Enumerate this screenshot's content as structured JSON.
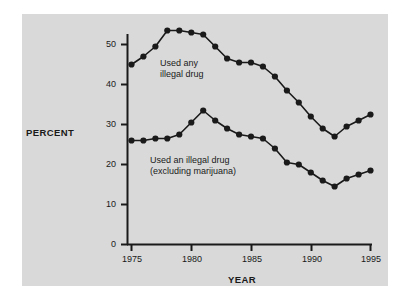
{
  "figure": {
    "background_color": "#ffffff",
    "panel_color": "#d9d9d9",
    "ink_color": "#1a1a1a"
  },
  "labels": {
    "y_axis_title": "PERCENT",
    "x_axis_title": "YEAR",
    "series_label_any": "Used any\nillegal drug",
    "series_label_excluding": "Used an illegal drug\n(excluding marijuana)"
  },
  "chart_data": {
    "type": "line",
    "title": "",
    "xlabel": "YEAR",
    "ylabel": "PERCENT",
    "xlim": [
      1975,
      1995
    ],
    "ylim": [
      0,
      55
    ],
    "xticks": [
      1975,
      1980,
      1985,
      1990,
      1995
    ],
    "yticks": [
      0,
      10,
      20,
      30,
      40,
      50
    ],
    "grid": false,
    "legend": "inline annotations",
    "marker": "filled circle",
    "x": [
      1975,
      1976,
      1977,
      1978,
      1979,
      1980,
      1981,
      1982,
      1983,
      1984,
      1985,
      1986,
      1987,
      1988,
      1989,
      1990,
      1991,
      1992,
      1993,
      1994,
      1995
    ],
    "series": [
      {
        "name": "Used any illegal drug",
        "values": [
          45,
          47,
          49.5,
          53.5,
          53.5,
          53,
          52.5,
          49.5,
          46.5,
          45.5,
          45.5,
          44.5,
          42,
          38.5,
          35.5,
          32,
          29,
          27,
          29.5,
          31,
          32.5
        ]
      },
      {
        "name": "Used an illegal drug (excluding marijuana)",
        "values": [
          26,
          26,
          26.5,
          26.5,
          27.5,
          30.5,
          33.5,
          31,
          29,
          27.5,
          27,
          26.5,
          24,
          20.5,
          20,
          18,
          16,
          14.5,
          16.5,
          17.5,
          18.5
        ]
      }
    ]
  }
}
